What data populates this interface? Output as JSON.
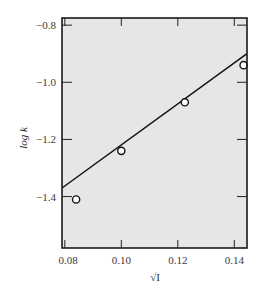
{
  "chart_data": {
    "type": "scatter",
    "title": "",
    "xlabel": "√I",
    "ylabel": "log k",
    "xlim": [
      0.079,
      0.1445
    ],
    "ylim": [
      -1.58,
      -0.775
    ],
    "x_ticks": [
      0.08,
      0.1,
      0.12,
      0.14
    ],
    "x_tick_labels": [
      "0.08",
      "0.10",
      "0.12",
      "0.14"
    ],
    "y_ticks": [
      -0.8,
      -1.0,
      -1.2,
      -1.4
    ],
    "y_tick_labels": [
      "−0.8",
      "−1.0",
      "−1.2",
      "−1.4"
    ],
    "grid": false,
    "legend": null,
    "series": [
      {
        "name": "measured",
        "marker": "open-circle",
        "x": [
          0.084,
          0.1,
          0.1225,
          0.1433
        ],
        "y": [
          -1.41,
          -1.24,
          -1.07,
          -0.94
        ]
      },
      {
        "name": "fit line",
        "style": "line",
        "x": [
          0.079,
          0.1445
        ],
        "y": [
          -1.37,
          -0.9
        ]
      }
    ],
    "colors": {
      "plot_background": "#e6e6e6",
      "frame": "#1a1a1a",
      "line": "#111111"
    }
  }
}
